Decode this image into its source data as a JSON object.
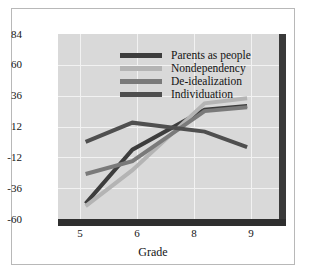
{
  "chart_data": {
    "type": "line",
    "title": "",
    "xlabel": "Grade",
    "ylabel": "",
    "xticks": [
      "5",
      "6",
      "8",
      "9"
    ],
    "xtick_values": [
      5,
      6,
      8,
      9
    ],
    "yticks": [
      "84",
      "60",
      "36",
      "12",
      "-12",
      "-36",
      "-60"
    ],
    "ytick_values": [
      84,
      60,
      36,
      12,
      -12,
      -36,
      -60
    ],
    "ylim": [
      -60,
      84
    ],
    "xlim": [
      4.65,
      9.85
    ],
    "grid": true,
    "legend_position": "upper-left-inside",
    "plot_background": "#d9d9d9",
    "series": [
      {
        "name": "Parents as people",
        "color": "#3d3d3d",
        "x": [
          5.3,
          6.4,
          8.1,
          9.1
        ],
        "values": [
          -48,
          -6,
          25,
          28
        ]
      },
      {
        "name": "Nondependency",
        "color": "#b4b4b4",
        "x": [
          5.3,
          6.4,
          8.1,
          9.1
        ],
        "values": [
          -50,
          -22,
          30,
          34
        ]
      },
      {
        "name": "De-idealization",
        "color": "#7a7a7a",
        "x": [
          5.3,
          6.4,
          8.1,
          9.1
        ],
        "values": [
          -25,
          -15,
          24,
          27
        ]
      },
      {
        "name": "Individuation",
        "color": "#4f4f4f",
        "x": [
          5.3,
          6.4,
          8.1,
          9.1
        ],
        "values": [
          0,
          15,
          8,
          -4
        ]
      }
    ]
  },
  "axes": {
    "x_label": "Grade"
  },
  "colors": {
    "plot_bg": "#d9d9d9",
    "grid": "#f2f2f2",
    "axis": "#2f2f2f",
    "figure_border": "#b8b8b8",
    "text": "#141414"
  }
}
